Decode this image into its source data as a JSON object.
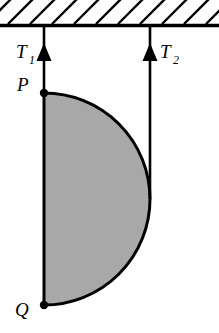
{
  "figure": {
    "background_color": "#ffffff",
    "line_color": "#000000",
    "fill_color": "#a8a8a8"
  },
  "ceiling": {
    "name": "hatched-ceiling",
    "y": 25,
    "x_start": 0,
    "x_end": 219,
    "thickness": 3,
    "hatch_count": 11,
    "hatch_spacing": 22,
    "hatch_length": 25,
    "hatch_angle_deg": 45
  },
  "strings": [
    {
      "name": "string-left",
      "label": "T",
      "subscript": "1",
      "label_x": 16,
      "label_y": 58,
      "sub_x": 30,
      "sub_y": 64,
      "x": 44,
      "y_top": 25,
      "y_bottom": 93,
      "arrow_tip_y": 44,
      "arrow_base_y": 60,
      "arrow_half_width": 7
    },
    {
      "name": "string-right",
      "label": "T",
      "subscript": "2",
      "label_x": 160,
      "label_y": 58,
      "sub_x": 174,
      "sub_y": 64,
      "x": 150,
      "y_top": 25,
      "y_bottom": 198,
      "arrow_tip_y": 44,
      "arrow_base_y": 60,
      "arrow_half_width": 7
    }
  ],
  "lamina": {
    "name": "semicircular-lamina",
    "shape": "semicircle",
    "diameter_x": 44,
    "top_y": 93,
    "bottom_y": 305,
    "center_y": 199,
    "radius": 106,
    "rightmost_x": 150,
    "stroke_width": 3
  },
  "points": [
    {
      "name": "point-p",
      "label": "P",
      "x": 44,
      "y": 93,
      "label_x": 18,
      "label_y": 90,
      "dot_radius": 4
    },
    {
      "name": "point-q",
      "label": "Q",
      "x": 44,
      "y": 305,
      "label_x": 16,
      "label_y": 315,
      "dot_radius": 4
    }
  ]
}
